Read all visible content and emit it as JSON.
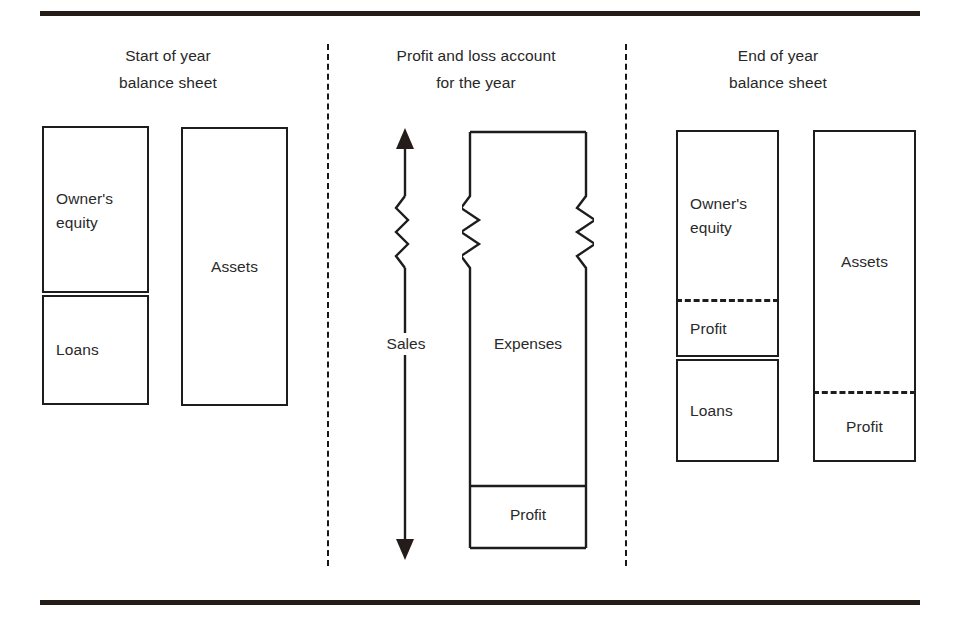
{
  "figure": {
    "background_color": "#ffffff",
    "line_color": "#1d1d1d",
    "rule_color": "#241c18"
  },
  "panels": [
    {
      "id": "start-of-year",
      "title_line1": "Start of year",
      "title_line2": "balance sheet"
    },
    {
      "id": "profit-and-loss",
      "title_line1": "Profit and loss account",
      "title_line2": "for the year"
    },
    {
      "id": "end-of-year",
      "title_line1": "End of year",
      "title_line2": "balance sheet"
    }
  ],
  "start_of_year": {
    "equity_column": {
      "segments": [
        {
          "label": "Owner's\nequity",
          "divider_below": "double"
        },
        {
          "label": "Loans",
          "divider_below": "none"
        }
      ]
    },
    "assets_column": {
      "segments": [
        {
          "label": "Assets",
          "divider_below": "none"
        }
      ]
    }
  },
  "profit_and_loss": {
    "sales_arrow": {
      "label": "Sales",
      "direction": "double-headed-vertical",
      "break_symbol": "zigzag"
    },
    "expenses_column": {
      "break_symbol": "zigzag",
      "segments": [
        {
          "label": "Expenses",
          "divider_below": "single"
        },
        {
          "label": "Profit",
          "divider_below": "none"
        }
      ]
    }
  },
  "end_of_year": {
    "equity_column": {
      "segments": [
        {
          "label": "Owner's\nequity",
          "divider_below": "dashed"
        },
        {
          "label": "Profit",
          "divider_below": "double"
        },
        {
          "label": "Loans",
          "divider_below": "none"
        }
      ]
    },
    "assets_column": {
      "segments": [
        {
          "label": "Assets",
          "divider_below": "dashed"
        },
        {
          "label": "Profit",
          "divider_below": "none"
        }
      ]
    }
  }
}
